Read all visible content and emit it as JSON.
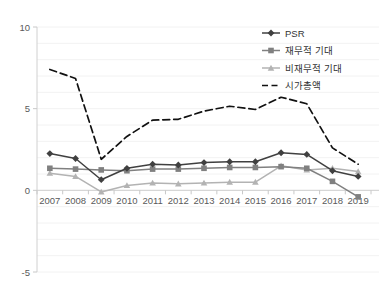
{
  "chart_data": {
    "type": "line",
    "title": "",
    "xlabel": "",
    "ylabel": "",
    "categories": [
      "2007",
      "2008",
      "2009",
      "2010",
      "2011",
      "2012",
      "2013",
      "2014",
      "2015",
      "2016",
      "2017",
      "2018",
      "2019"
    ],
    "ylim": [
      -5,
      10
    ],
    "yticks": [
      10,
      5,
      0,
      -5
    ],
    "ytick_labels": [
      "10",
      "5",
      "0",
      "-5"
    ],
    "grid": true,
    "grid_orientation": "horizontal",
    "legend_position": "top-right",
    "series": [
      {
        "name": "PSR",
        "color": "#404040",
        "marker": "diamond",
        "line_style": "solid",
        "values": [
          2.25,
          1.95,
          0.65,
          1.35,
          1.6,
          1.55,
          1.7,
          1.75,
          1.75,
          2.3,
          2.2,
          1.2,
          0.85
        ]
      },
      {
        "name": "재무적 기대",
        "color": "#808080",
        "marker": "square",
        "line_style": "solid",
        "values": [
          1.35,
          1.3,
          1.25,
          1.2,
          1.3,
          1.3,
          1.35,
          1.4,
          1.4,
          1.45,
          1.35,
          0.55,
          -0.4
        ]
      },
      {
        "name": "비재무적 기대",
        "color": "#b3b3b3",
        "marker": "triangle",
        "line_style": "solid",
        "values": [
          1.05,
          0.85,
          -0.1,
          0.3,
          0.45,
          0.4,
          0.45,
          0.5,
          0.5,
          1.5,
          1.25,
          1.35,
          1.15
        ]
      },
      {
        "name": "시가총액",
        "color": "#111111",
        "marker": "none",
        "line_style": "dashed",
        "values": [
          7.4,
          6.85,
          1.9,
          3.3,
          4.3,
          4.35,
          4.85,
          5.15,
          4.95,
          5.7,
          5.3,
          2.6,
          1.6
        ]
      }
    ]
  }
}
